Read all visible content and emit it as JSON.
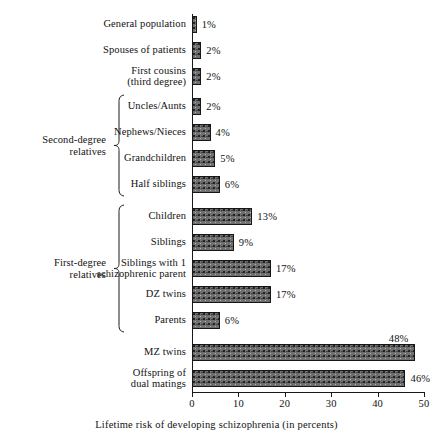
{
  "chart_data": {
    "type": "bar",
    "orientation": "horizontal",
    "title": "",
    "xlabel": "Lifetime risk of developing schizophrenia (in percents)",
    "ylabel": "",
    "xlim": [
      0,
      50
    ],
    "xticks": [
      0,
      10,
      20,
      30,
      40,
      50
    ],
    "xtick_labels": [
      "0",
      "10",
      "20",
      "30",
      "40",
      "50"
    ],
    "grid": false,
    "legend": null,
    "categories": [
      "General population",
      "Spouses of patients",
      "First cousins\n(third degree)",
      "Uncles/Aunts",
      "Nephews/Nieces",
      "Grandchildren",
      "Half siblings",
      "Children",
      "Siblings",
      "Siblings with 1\nschizophrenic parent",
      "DZ twins",
      "Parents",
      "MZ twins",
      "Offspring of\ndual matings"
    ],
    "values": [
      1,
      2,
      2,
      2,
      4,
      5,
      6,
      13,
      9,
      17,
      17,
      6,
      48,
      46
    ],
    "data_labels": [
      "1%",
      "2%",
      "2%",
      "2%",
      "4%",
      "5%",
      "6%",
      "13%",
      "9%",
      "17%",
      "17%",
      "6%",
      "48%",
      "46%"
    ],
    "label_placement": [
      "inline",
      "inline",
      "inline",
      "inline",
      "inline",
      "inline",
      "inline",
      "inline",
      "inline",
      "inline",
      "inline",
      "inline",
      "above",
      "inline"
    ],
    "groups": [
      {
        "label": "Second-degree\nrelatives",
        "members": [
          "Uncles/Aunts",
          "Nephews/Nieces",
          "Grandchildren",
          "Half siblings"
        ],
        "first_index": 3,
        "last_index": 6
      },
      {
        "label": "First-degree\nrelatives",
        "members": [
          "Children",
          "Siblings",
          "Siblings with 1 schizophrenic parent",
          "DZ twins",
          "Parents"
        ],
        "first_index": 7,
        "last_index": 11
      }
    ]
  },
  "colors": {
    "bar_fill": "#6f6f6f",
    "bar_stroke": "#171717",
    "axis": "#1a1a1a",
    "text": "#111111",
    "background": "#ffffff"
  }
}
